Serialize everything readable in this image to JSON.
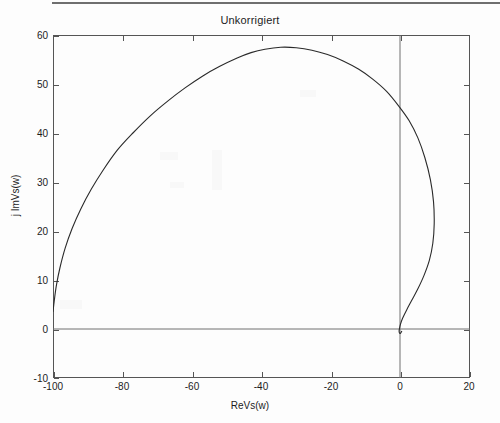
{
  "chart_data": {
    "type": "line",
    "title": "Unkorrigiert",
    "xlabel": "ReVs(w)",
    "ylabel": "j ImVs(w)",
    "xlim": [
      -100,
      20
    ],
    "ylim": [
      -10,
      60
    ],
    "xticks": [
      -100,
      -80,
      -60,
      -40,
      -20,
      0,
      20
    ],
    "xtick_labels": [
      "-100",
      "-80",
      "-60",
      "-40",
      "-20",
      "0",
      "20"
    ],
    "yticks": [
      -10,
      0,
      10,
      20,
      30,
      40,
      50,
      60
    ],
    "ytick_labels": [
      "-10",
      "0",
      "10",
      "20",
      "30",
      "40",
      "50",
      "60"
    ],
    "grid": false,
    "legend": null,
    "series": [
      {
        "name": "Nyquist locus",
        "comment": "Open-loop Nyquist curve, uncorrected system",
        "x": [
          -100.0,
          -99.6,
          -99.0,
          -98.0,
          -96.5,
          -94.5,
          -92.0,
          -89.0,
          -85.5,
          -81.5,
          -77.0,
          -72.0,
          -67.0,
          -62.0,
          -57.0,
          -52.0,
          -47.0,
          -43.0,
          -39.0,
          -34.5,
          -30.0,
          -25.5,
          -21.0,
          -16.5,
          -12.0,
          -8.0,
          -4.0,
          -0.5,
          2.5,
          5.0,
          7.0,
          8.6,
          9.5,
          9.7,
          9.3,
          8.3,
          6.8,
          5.0,
          3.2,
          1.7,
          0.6,
          0.0,
          -0.3,
          -0.4,
          -0.2,
          0.1,
          0.4
        ],
        "y": [
          3.5,
          6.0,
          9.0,
          12.5,
          16.5,
          20.5,
          24.5,
          28.5,
          32.5,
          36.5,
          40.0,
          43.5,
          46.5,
          49.2,
          51.6,
          53.6,
          55.3,
          56.4,
          57.1,
          57.5,
          57.4,
          56.9,
          56.0,
          54.7,
          53.0,
          51.0,
          48.5,
          45.5,
          42.5,
          39.0,
          35.0,
          30.5,
          26.0,
          21.5,
          17.5,
          14.0,
          11.0,
          8.2,
          5.8,
          3.8,
          2.2,
          1.0,
          0.1,
          -0.5,
          -0.9,
          -0.8,
          -0.4
        ]
      }
    ],
    "axis_lines": {
      "x_axis_at_y": 0,
      "y_axis_at_x": 0
    }
  },
  "axes": {
    "title": "Unkorrigiert",
    "x_axis_label": "ReVs(w)",
    "y_axis_label": "j ImVs(w)"
  }
}
